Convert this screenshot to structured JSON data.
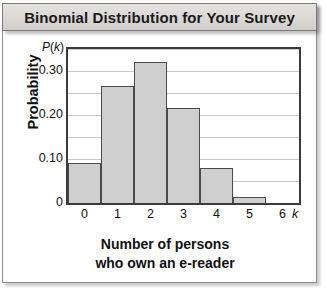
{
  "header": {
    "title": "Binomial Distribution for Your Survey"
  },
  "axis_titles": {
    "y": "Probability",
    "y_symbol_p": "P",
    "y_symbol_paren_open": "(",
    "y_symbol_k": "k",
    "y_symbol_paren_close": ")",
    "x_line1": "Number of persons",
    "x_line2": "who own an e-reader",
    "x_variable": "k"
  },
  "colors": {
    "bar_fill": "#cfcfcf",
    "bar_stroke": "#4a4a4a",
    "plot_border": "#3a3a3a",
    "gridline": "#c9c9c9",
    "title_bar_bg": "#d9d8d5",
    "text": "#111111"
  },
  "chart_data": {
    "type": "bar",
    "title": "Binomial Distribution for Your Survey",
    "xlabel": "Number of persons who own an e-reader",
    "ylabel": "Probability",
    "x_variable": "k",
    "y_variable": "P(k)",
    "categories": [
      "0",
      "1",
      "2",
      "3",
      "4",
      "5",
      "6"
    ],
    "values": [
      0.09,
      0.265,
      0.32,
      0.215,
      0.08,
      0.013,
      0.001
    ],
    "ylim": [
      0,
      0.35
    ],
    "xlim": [
      0,
      7
    ],
    "ytick_labels": [
      "0",
      "0.10",
      "0.20",
      "0.30"
    ],
    "ytick_values": [
      0,
      0.1,
      0.2,
      0.3
    ],
    "xtick_labels": [
      "0",
      "1",
      "2",
      "3",
      "4",
      "5",
      "6"
    ],
    "gridlines": [
      0.05,
      0.1,
      0.15,
      0.2,
      0.25,
      0.3,
      0.35
    ],
    "grid": true,
    "legend": false,
    "legend_position": "none"
  }
}
